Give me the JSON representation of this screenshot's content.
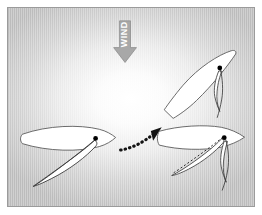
{
  "figure": {
    "panel": {
      "background_edge_color": "#bcbcbc",
      "background_center_color": "#ffffff",
      "border_color": "#9b9b9b"
    }
  },
  "wind_indicator": {
    "label": "WIND",
    "direction": "down",
    "arrow_color": "#a8a8a8",
    "arrow_outline_color": "#8f8f8f",
    "label_color": "#ffffff",
    "label_rotation_degrees": -90
  },
  "motion_arrow": {
    "name": "tack-path-arrow",
    "style": "dotted",
    "color": "#141414",
    "direction": "up-right",
    "description": "Dotted curved arrow from the left boat to the right boats"
  },
  "boats": [
    {
      "id": "boat-left",
      "label": "Boat before tack",
      "heading": "starboard-reach-right",
      "hull_fill": "#ffffff",
      "hull_stroke": "#5a5a5a",
      "sail_fill": "#ffffff",
      "sail_stroke": "#3c3c3c",
      "mast_color": "#000000",
      "sail_state": "trimmed"
    },
    {
      "id": "boat-upper-right",
      "label": "Boat head to wind",
      "heading": "up-right-tilted",
      "hull_fill": "#ffffff",
      "hull_stroke": "#5a5a5a",
      "sail_fill": "#ffffff",
      "sail_stroke": "#3c3c3c",
      "mast_color": "#000000",
      "sail_state": "luffing"
    },
    {
      "id": "boat-lower-right",
      "label": "Boat after tack",
      "heading": "right",
      "hull_fill": "#ffffff",
      "hull_stroke": "#5a5a5a",
      "sail_fill": "#ffffff",
      "sail_stroke": "#3c3c3c",
      "mast_color": "#000000",
      "sail_state": "new-tack-with-previous-position-dashed",
      "dashed_line_color": "#2b2b2b"
    }
  ]
}
